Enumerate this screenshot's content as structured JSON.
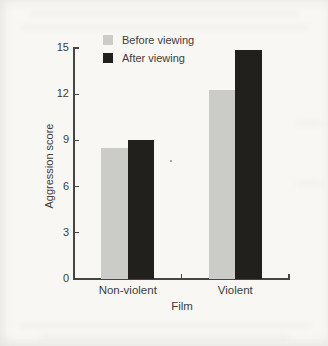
{
  "figure": {
    "kind": "scanned-textbook-bar-chart"
  },
  "colors": {
    "background": "#f8f7f4",
    "axis": "#454543",
    "text": "#3d3d3b",
    "bar_before": "#cbccc8",
    "bar_after": "#21201d"
  },
  "chart_data": {
    "type": "bar",
    "title": "",
    "xlabel": "Film",
    "ylabel": "Aggression score",
    "categories": [
      "Non-violent",
      "Violent"
    ],
    "series": [
      {
        "name": "Before viewing",
        "color": "#cbccc8",
        "values": [
          8.5,
          12.3
        ]
      },
      {
        "name": "After viewing",
        "color": "#21201d",
        "values": [
          9.0,
          14.9
        ]
      }
    ],
    "ylim": [
      0,
      15
    ],
    "yticks": [
      0,
      3,
      6,
      9,
      12,
      15
    ],
    "legend_position": "top-inside",
    "grid": false
  }
}
